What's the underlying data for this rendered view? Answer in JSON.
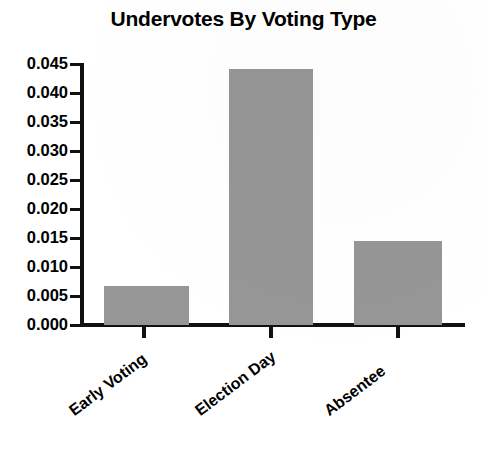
{
  "chart_data": {
    "type": "bar",
    "title": "Undervotes By Voting Type",
    "xlabel": "",
    "ylabel": "",
    "categories": [
      "Early Voting",
      "Election Day",
      "Absentee"
    ],
    "values": [
      0.0068,
      0.0442,
      0.0145
    ],
    "ylim": [
      0.0,
      0.045
    ],
    "ytick_values": [
      0.0,
      0.005,
      0.01,
      0.015,
      0.02,
      0.025,
      0.03,
      0.035,
      0.04,
      0.045
    ],
    "ytick_labels": [
      "0.000",
      "0.005",
      "0.010",
      "0.015",
      "0.020",
      "0.025",
      "0.030",
      "0.035",
      "0.040",
      "0.045"
    ],
    "grid": false,
    "legend": null,
    "bar_color": "#969696",
    "axis_color": "#111111",
    "background_color": "#ffffff",
    "xtick_label_rotation": -37
  },
  "axis": {
    "ticks": [
      {
        "label": "0.045",
        "value": 0.045
      },
      {
        "label": "0.040",
        "value": 0.04
      },
      {
        "label": "0.035",
        "value": 0.035
      },
      {
        "label": "0.030",
        "value": 0.03
      },
      {
        "label": "0.025",
        "value": 0.025
      },
      {
        "label": "0.020",
        "value": 0.02
      },
      {
        "label": "0.015",
        "value": 0.015
      },
      {
        "label": "0.010",
        "value": 0.01
      },
      {
        "label": "0.005",
        "value": 0.005
      },
      {
        "label": "0.000",
        "value": 0.0
      }
    ]
  }
}
